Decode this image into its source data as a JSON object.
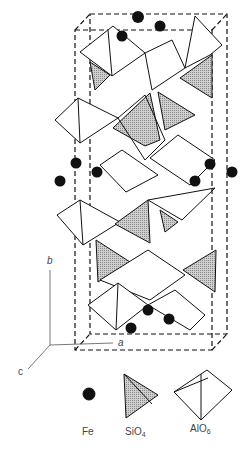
{
  "figure": {
    "type": "crystal-structure",
    "axes": {
      "a": "a",
      "b": "b",
      "c": "c"
    },
    "legend": [
      {
        "symbol": "filled-circle",
        "label": "Fe",
        "sub": ""
      },
      {
        "symbol": "shaded-tetrahedron",
        "label": "SiO",
        "sub": "4"
      },
      {
        "symbol": "open-octahedron",
        "label": "AlO",
        "sub": "6"
      }
    ],
    "colors": {
      "line": "#111111",
      "shade": "#b8b8b8",
      "atom": "#111111"
    }
  }
}
